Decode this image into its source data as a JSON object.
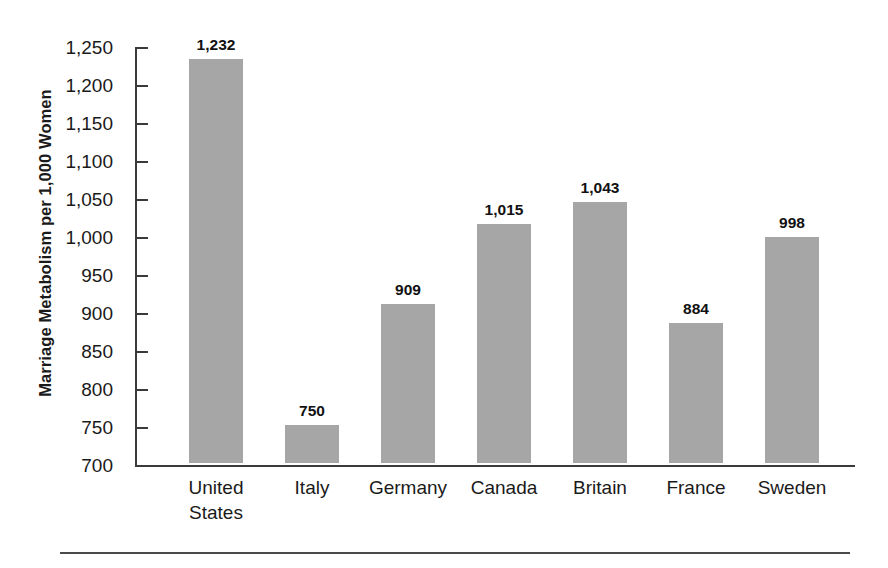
{
  "chart_data": {
    "type": "bar",
    "title": "",
    "xlabel": "",
    "ylabel": "Marriage Metabolism per 1,000 Women",
    "categories": [
      "United States",
      "Italy",
      "Germany",
      "Canada",
      "Britain",
      "France",
      "Sweden"
    ],
    "category_labels_wrapped": [
      "United\nStates",
      "Italy",
      "Germany",
      "Canada",
      "Britain",
      "France",
      "Sweden"
    ],
    "values": [
      1232,
      750,
      909,
      1015,
      1043,
      884,
      998
    ],
    "value_labels": [
      "1,232",
      "750",
      "909",
      "1,015",
      "1,043",
      "884",
      "998"
    ],
    "ylim": [
      700,
      1250
    ],
    "ytick_values": [
      700,
      750,
      800,
      850,
      900,
      950,
      1000,
      1050,
      1100,
      1150,
      1200,
      1250
    ],
    "ytick_labels": [
      "700",
      "750",
      "800",
      "850",
      "900",
      "950",
      "1,000",
      "1,050",
      "1,100",
      "1,150",
      "1,200",
      "1,250"
    ],
    "grid": false,
    "legend": "none",
    "bar_color": "#a6a6a6",
    "axis_color": "#3a3a3a",
    "text_color": "#1a1a1a",
    "background_color": "#ffffff"
  }
}
